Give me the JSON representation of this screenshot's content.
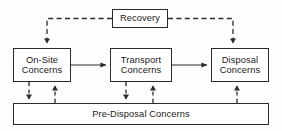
{
  "diagram": {
    "type": "block-flow-diagram",
    "colors": {
      "background": "#fdfdfb",
      "box_fill": "#ffffff",
      "stroke": "#2b2b2b",
      "text": "#1a1a1a"
    },
    "nodes": [
      {
        "id": "recovery",
        "label": "Recovery",
        "lines": [
          "Recovery"
        ],
        "position": "top-center"
      },
      {
        "id": "onsite",
        "label": "On-Site Concerns",
        "lines": [
          "On-Site",
          "Concerns"
        ],
        "position": "middle-left"
      },
      {
        "id": "transport",
        "label": "Transport Concerns",
        "lines": [
          "Transport",
          "Concerns"
        ],
        "position": "middle-center"
      },
      {
        "id": "disposal",
        "label": "Disposal Concerns",
        "lines": [
          "Disposal",
          "Concerns"
        ],
        "position": "middle-right"
      },
      {
        "id": "predisposal",
        "label": "Pre-Disposal Concerns",
        "lines": [
          "Pre-Disposal Concerns"
        ],
        "position": "bottom-full-width"
      }
    ],
    "edges": [
      {
        "id": "onsite-to-transport",
        "from": "onsite",
        "to": "transport",
        "style": "solid",
        "direction": "right"
      },
      {
        "id": "transport-to-disposal",
        "from": "transport",
        "to": "disposal",
        "style": "solid",
        "direction": "right"
      },
      {
        "id": "recovery-to-onsite",
        "from": "recovery",
        "to": "onsite",
        "style": "dashed",
        "direction": "down"
      },
      {
        "id": "recovery-to-disposal",
        "from": "recovery",
        "to": "disposal",
        "style": "dashed",
        "direction": "down"
      },
      {
        "id": "onsite-to-predisposal",
        "from": "onsite",
        "to": "predisposal",
        "style": "dashed",
        "direction": "down"
      },
      {
        "id": "predisposal-to-onsite",
        "from": "predisposal",
        "to": "onsite",
        "style": "dashed",
        "direction": "up"
      },
      {
        "id": "transport-to-predisposal",
        "from": "transport",
        "to": "predisposal",
        "style": "dashed",
        "direction": "down"
      },
      {
        "id": "predisposal-to-transport",
        "from": "predisposal",
        "to": "transport",
        "style": "dashed",
        "direction": "up"
      },
      {
        "id": "predisposal-to-disposal",
        "from": "predisposal",
        "to": "disposal",
        "style": "dashed",
        "direction": "up"
      }
    ]
  }
}
